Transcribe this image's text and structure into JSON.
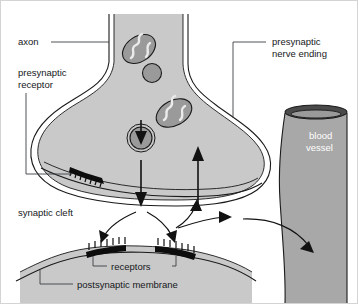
{
  "figure": {
    "background_color": "#ffffff",
    "cell_fill_color": "#c9c9c9",
    "vessel_fill_color": "#a8a8a8",
    "organelle_color": "#9a9a9a",
    "outline_color": "#1a1a1a",
    "label_color": "#16181a"
  },
  "labels": {
    "axon": "axon",
    "presynaptic_receptor_line1": "presynaptic",
    "presynaptic_receptor_line2": "receptor",
    "presynaptic_nerve_ending_line1": "presynaptic",
    "presynaptic_nerve_ending_line2": "nerve ending",
    "blood_vessel_line1": "blood",
    "blood_vessel_line2": "vessel",
    "synaptic_cleft": "synaptic cleft",
    "receptors": "receptors",
    "postsynaptic_membrane": "postsynaptic membrane"
  },
  "structures": {
    "axon_terminal": "presynaptic nerve ending",
    "blood_vessel": "blood vessel",
    "postsynaptic_cell": "postsynaptic membrane",
    "mitochondria_count": 2,
    "vesicle_count": 2,
    "receptor_patch_count": 2,
    "presynaptic_receptor_patch_count": 1
  }
}
